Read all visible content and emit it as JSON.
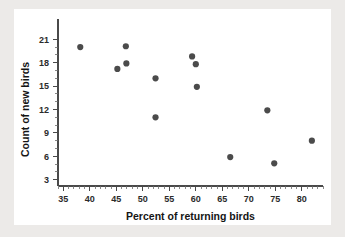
{
  "chart_data": {
    "type": "scatter",
    "title": "",
    "xlabel": "Percent of returning birds",
    "ylabel": "Count of new birds",
    "xlim": [
      34,
      84
    ],
    "ylim": [
      2.2,
      21.8
    ],
    "xticks": [
      35,
      40,
      45,
      50,
      55,
      60,
      65,
      70,
      75,
      80
    ],
    "yticks": [
      3,
      6,
      9,
      12,
      15,
      18,
      21
    ],
    "xtick_labels": [
      "35",
      "40",
      "45",
      "50",
      "55",
      "60",
      "65",
      "70",
      "75",
      "80"
    ],
    "ytick_labels": [
      "3",
      "6",
      "9",
      "12",
      "15",
      "18",
      "21"
    ],
    "x_minor_step": 1,
    "y_minor_step": 1,
    "grid": false,
    "legend": null,
    "marker": "circle",
    "marker_color": "#4b4b4b",
    "marker_size": 3.1,
    "points": [
      {
        "x": 38.2,
        "y": 20.0
      },
      {
        "x": 45.2,
        "y": 17.2
      },
      {
        "x": 46.8,
        "y": 20.1
      },
      {
        "x": 46.9,
        "y": 17.9
      },
      {
        "x": 52.4,
        "y": 16.0
      },
      {
        "x": 52.4,
        "y": 11.0
      },
      {
        "x": 59.3,
        "y": 18.8
      },
      {
        "x": 60.0,
        "y": 17.8
      },
      {
        "x": 60.2,
        "y": 14.9
      },
      {
        "x": 66.5,
        "y": 5.9
      },
      {
        "x": 73.5,
        "y": 11.9
      },
      {
        "x": 74.8,
        "y": 5.1
      },
      {
        "x": 81.9,
        "y": 8.0
      }
    ]
  },
  "figure": {
    "background_color": "#eceae8",
    "panel_color": "#ffffff",
    "axis_color": "#4a4a4a",
    "text_color": "#151515"
  }
}
